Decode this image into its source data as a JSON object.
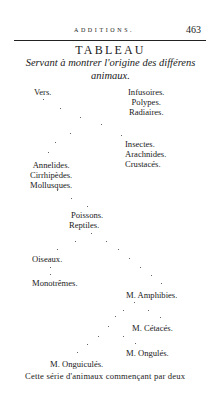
{
  "header": {
    "running_head": "ADDITIONS.",
    "page_number": "463"
  },
  "table": {
    "title": "TABLEAU",
    "subtitle_line1": "Servant à montrer l'origine des différens",
    "subtitle_line2": "animaux.",
    "left_branch": {
      "vers": "Vers.",
      "group_annelides": [
        "Annelides.",
        "Cirrhipèdes.",
        "Mollusques."
      ],
      "group_poissons": [
        "Poissons.",
        "Reptiles."
      ],
      "oiseaux": "Oiseaux.",
      "monotremes": "Monotrêmes."
    },
    "right_branch": {
      "group_infusoires": [
        "Infusoires.",
        "Polypes.",
        "Radiaires."
      ],
      "group_insectes": [
        "Insectes.",
        "Arachnides.",
        "Crustacés."
      ]
    },
    "mammals": {
      "amphibies": "M. Amphibies.",
      "cetaces": "M. Cétacés.",
      "ongules": "M. Ongulés.",
      "onguicules": "M. Onguiculés."
    }
  },
  "body_text": "Cette série d'animaux commençant par deux"
}
